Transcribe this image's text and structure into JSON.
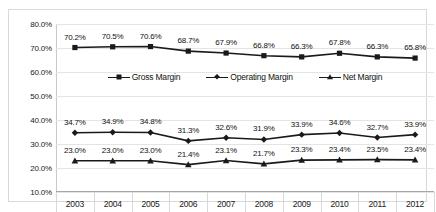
{
  "chart_data": {
    "type": "line",
    "title": "",
    "subtitle": "",
    "xlabel": "",
    "ylabel": "",
    "categories": [
      "2003",
      "2004",
      "2005",
      "2006",
      "2007",
      "2008",
      "2009",
      "2010",
      "2011",
      "2012"
    ],
    "ylim": [
      10.0,
      80.0
    ],
    "ytick_values": [
      10.0,
      20.0,
      30.0,
      40.0,
      50.0,
      60.0,
      70.0,
      80.0
    ],
    "ytick_labels": [
      "10.0%",
      "20.0%",
      "30.0%",
      "40.0%",
      "50.0%",
      "60.0%",
      "70.0%",
      "80.0%"
    ],
    "grid": true,
    "legend_position": "center-middle",
    "value_suffix": "%",
    "series": [
      {
        "name": "Gross Margin",
        "marker": "square",
        "color": "#1a1a1a",
        "values": [
          70.2,
          70.5,
          70.6,
          68.7,
          67.9,
          66.8,
          66.3,
          67.8,
          66.3,
          65.8
        ],
        "labels": [
          "70.2%",
          "70.5%",
          "70.6%",
          "68.7%",
          "67.9%",
          "66.8%",
          "66.3%",
          "67.8%",
          "66.3%",
          "65.8%"
        ]
      },
      {
        "name": "Operating Margin",
        "marker": "diamond",
        "color": "#1a1a1a",
        "values": [
          34.7,
          34.9,
          34.8,
          31.3,
          32.6,
          31.9,
          33.9,
          34.6,
          32.7,
          33.9
        ],
        "labels": [
          "34.7%",
          "34.9%",
          "34.8%",
          "31.3%",
          "32.6%",
          "31.9%",
          "33.9%",
          "34.6%",
          "32.7%",
          "33.9%"
        ]
      },
      {
        "name": "Net Margin",
        "marker": "triangle",
        "color": "#1a1a1a",
        "values": [
          23.0,
          23.0,
          23.0,
          21.4,
          23.1,
          21.7,
          23.3,
          23.4,
          23.5,
          23.4
        ],
        "labels": [
          "23.0%",
          "23.0%",
          "23.0%",
          "21.4%",
          "23.1%",
          "21.7%",
          "23.3%",
          "23.4%",
          "23.5%",
          "23.4%"
        ]
      }
    ]
  }
}
